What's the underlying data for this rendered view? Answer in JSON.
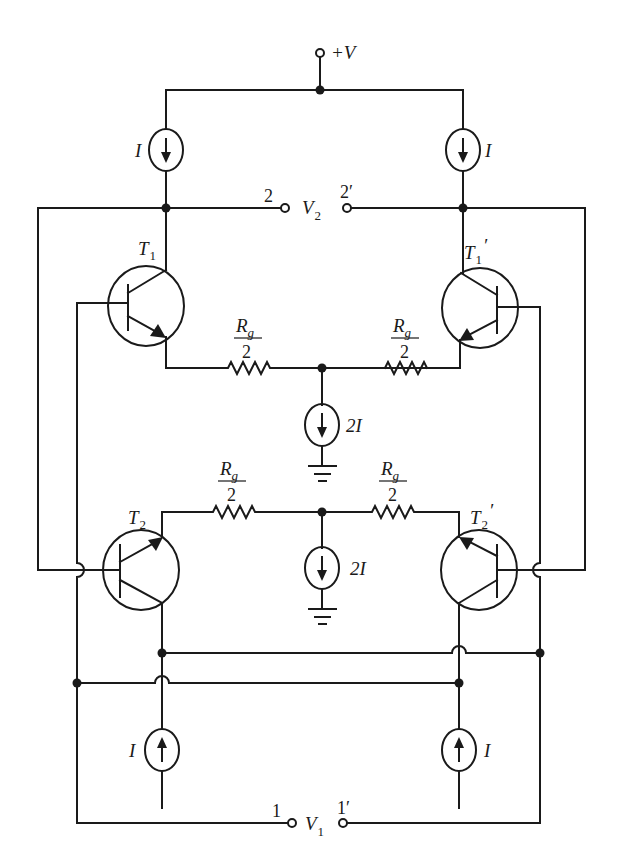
{
  "diagram": {
    "type": "circuit-schematic",
    "colors": {
      "ink": "#1a1a1a",
      "background": "#ffffff"
    },
    "supply": {
      "top": {
        "label": "+V"
      },
      "bottom": {
        "label": "+V"
      }
    },
    "current_sources": {
      "top_left": {
        "label": "I",
        "direction": "down"
      },
      "top_right": {
        "label": "I",
        "direction": "down"
      },
      "mid_upper": {
        "label": "2I",
        "direction": "down"
      },
      "mid_lower": {
        "label": "2I",
        "direction": "down"
      },
      "bottom_left": {
        "label": "I",
        "direction": "up"
      },
      "bottom_right": {
        "label": "I",
        "direction": "up"
      }
    },
    "transistors": {
      "t1": {
        "label": "T",
        "sub": "1",
        "prime": ""
      },
      "t1p": {
        "label": "T",
        "sub": "1",
        "prime": "′"
      },
      "t2": {
        "label": "T",
        "sub": "2",
        "prime": ""
      },
      "t2p": {
        "label": "T",
        "sub": "2",
        "prime": "′"
      }
    },
    "resistors": {
      "upper_left": {
        "num": "R",
        "num_sub": "g",
        "den": "2"
      },
      "upper_right": {
        "num": "R",
        "num_sub": "g",
        "den": "2"
      },
      "lower_left": {
        "num": "R",
        "num_sub": "g",
        "den": "2"
      },
      "lower_right": {
        "num": "R",
        "num_sub": "g",
        "den": "2"
      }
    },
    "ports": {
      "output": {
        "left_terminal": "2",
        "right_terminal": "2′",
        "voltage": "V",
        "voltage_sub": "2"
      },
      "input": {
        "left_terminal": "1",
        "right_terminal": "1′",
        "voltage": "V",
        "voltage_sub": "1"
      }
    }
  }
}
